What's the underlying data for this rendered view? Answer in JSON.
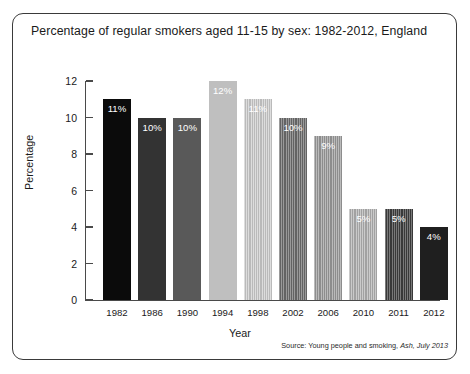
{
  "figure": {
    "title": "Percentage of regular smokers aged 11-15 by sex: 1982-2012, England",
    "source_prefix": "Source: Young people and smoking,",
    "source_italic": "Ash, July 2013"
  },
  "chart_data": {
    "type": "bar",
    "title": "Percentage of regular smokers aged 11-15 by sex: 1982-2012, England",
    "xlabel": "Year",
    "ylabel": "Percentage",
    "ylim": [
      0,
      12
    ],
    "yticks": [
      0,
      2,
      4,
      6,
      8,
      10,
      12
    ],
    "ytick_labels": [
      "0",
      "2",
      "4",
      "6",
      "8",
      "10",
      "12"
    ],
    "grid": false,
    "legend": "none",
    "categories": [
      "1982",
      "1986",
      "1990",
      "1994",
      "1998",
      "2002",
      "2006",
      "2010",
      "2011",
      "2012"
    ],
    "values": [
      11,
      10,
      10,
      12,
      11,
      10,
      9,
      5,
      5,
      4
    ],
    "data_labels": [
      "11%",
      "10%",
      "10%",
      "12%",
      "11%",
      "10%",
      "9%",
      "5%",
      "5%",
      "4%"
    ],
    "bar_colors": [
      "#0b0b0b",
      "#333333",
      "#595959",
      "#bfbfbf",
      "#cfcfcf",
      "#6e6e6e",
      "#9d9d9d",
      "#b3b3b3",
      "#3f3f3f",
      "#1f1f1f"
    ],
    "bar_textures": [
      "solid",
      "solid",
      "solid",
      "solid",
      "striped",
      "striped",
      "striped",
      "striped",
      "striped",
      "solid"
    ]
  }
}
